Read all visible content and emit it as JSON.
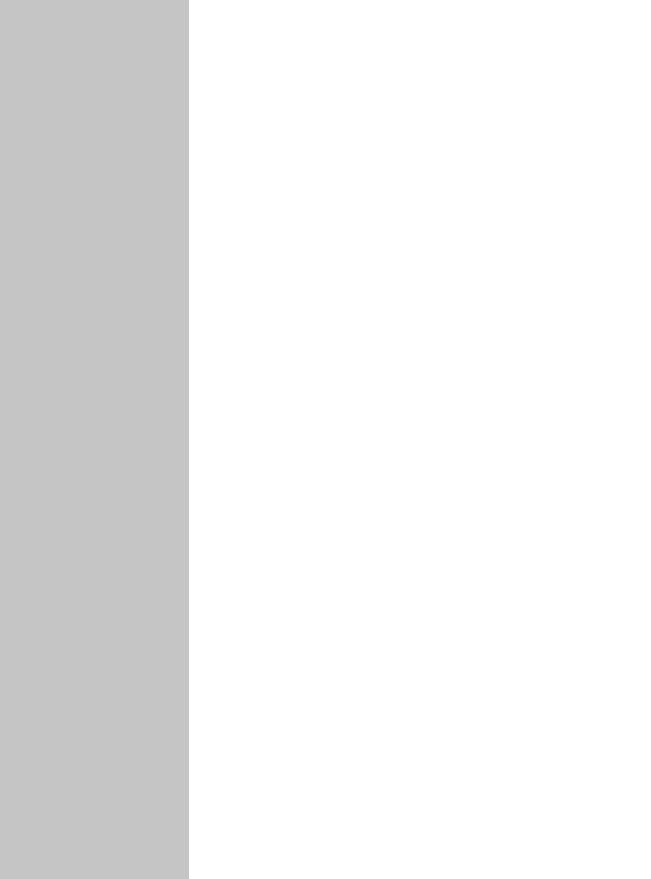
{
  "layout": {
    "sidebar": {
      "background": "#c5c5c5",
      "items": []
    },
    "main": {
      "background": "#ffffff",
      "content": []
    }
  }
}
